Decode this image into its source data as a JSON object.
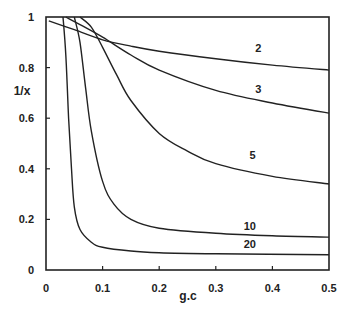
{
  "chart_data": {
    "type": "line",
    "title": "",
    "xlabel": "g.c",
    "ylabel": "1/x",
    "xlim": [
      0,
      0.5
    ],
    "ylim": [
      0,
      1
    ],
    "grid": false,
    "legend": "inline curve labels",
    "x_ticks": [
      "0",
      "0.1",
      "0.2",
      "0.3",
      "0.4",
      "0.5"
    ],
    "y_ticks": [
      "0",
      "0.2",
      "0.4",
      "0.6",
      "0.8",
      "1"
    ],
    "series": [
      {
        "name": "2",
        "x": [
          0.005,
          0.05,
          0.1,
          0.15,
          0.2,
          0.3,
          0.4,
          0.5
        ],
        "values": [
          0.985,
          0.95,
          0.91,
          0.885,
          0.865,
          0.835,
          0.81,
          0.79
        ]
      },
      {
        "name": "3",
        "x": [
          0.035,
          0.06,
          0.1,
          0.15,
          0.2,
          0.3,
          0.4,
          0.5
        ],
        "values": [
          1.0,
          0.97,
          0.92,
          0.85,
          0.79,
          0.71,
          0.66,
          0.62
        ]
      },
      {
        "name": "5",
        "x": [
          0.06,
          0.08,
          0.1,
          0.125,
          0.15,
          0.2,
          0.25,
          0.3,
          0.4,
          0.5
        ],
        "values": [
          1.0,
          0.96,
          0.88,
          0.77,
          0.67,
          0.54,
          0.47,
          0.42,
          0.37,
          0.34
        ]
      },
      {
        "name": "10",
        "x": [
          0.05,
          0.06,
          0.07,
          0.08,
          0.1,
          0.12,
          0.15,
          0.2,
          0.3,
          0.4,
          0.5
        ],
        "values": [
          1.0,
          0.9,
          0.72,
          0.55,
          0.35,
          0.26,
          0.2,
          0.165,
          0.145,
          0.135,
          0.13
        ]
      },
      {
        "name": "20",
        "x": [
          0.03,
          0.035,
          0.04,
          0.045,
          0.05,
          0.06,
          0.08,
          0.1,
          0.15,
          0.2,
          0.3,
          0.5
        ],
        "values": [
          1.0,
          0.85,
          0.6,
          0.4,
          0.25,
          0.16,
          0.11,
          0.09,
          0.075,
          0.068,
          0.064,
          0.06
        ]
      }
    ],
    "annotations": [
      {
        "text": "2",
        "x": 0.375,
        "y": 0.86
      },
      {
        "text": "3",
        "x": 0.375,
        "y": 0.7
      },
      {
        "text": "5",
        "x": 0.365,
        "y": 0.44
      },
      {
        "text": "10",
        "x": 0.36,
        "y": 0.16
      },
      {
        "text": "20",
        "x": 0.36,
        "y": 0.085
      }
    ]
  },
  "axes": {
    "xlabel": "g.c",
    "ylabel": "1/x"
  }
}
